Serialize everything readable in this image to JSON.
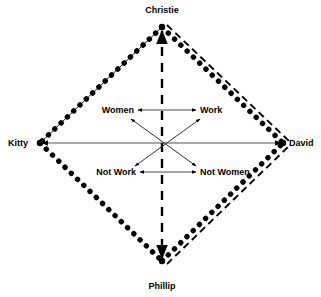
{
  "diagram": {
    "type": "semiotic-square",
    "title": "",
    "background_color": "#ffffff",
    "line_color": "#000000",
    "vertices": [
      {
        "id": "top",
        "label": "Christie",
        "x": 162,
        "y": 10,
        "point_x": 162,
        "point_y": 27
      },
      {
        "id": "left",
        "label": "Kitty",
        "x": 8,
        "y": 143,
        "point_x": 40,
        "point_y": 143
      },
      {
        "id": "right",
        "label": "David",
        "x": 313,
        "y": 143,
        "point_x": 283,
        "point_y": 143
      },
      {
        "id": "bottom",
        "label": "Phillip",
        "x": 162,
        "y": 286,
        "point_x": 162,
        "point_y": 261
      }
    ],
    "inner_labels": [
      {
        "id": "women",
        "label": "Women",
        "x": 104,
        "y": 110
      },
      {
        "id": "work",
        "label": "Work",
        "x": 215,
        "y": 110
      },
      {
        "id": "not_work",
        "label": "Not Work",
        "x": 105,
        "y": 172
      },
      {
        "id": "not_women",
        "label": "Not Women",
        "x": 217,
        "y": 172
      }
    ],
    "edges": [
      {
        "id": "top-left-edge",
        "from": "top",
        "to": "left",
        "styles": [
          "dotted",
          "thin-solid"
        ]
      },
      {
        "id": "top-right-edge",
        "from": "top",
        "to": "right",
        "styles": [
          "dotted",
          "dashed"
        ]
      },
      {
        "id": "bottom-left-edge",
        "from": "left",
        "to": "bottom",
        "styles": [
          "dotted"
        ]
      },
      {
        "id": "bottom-right-edge",
        "from": "bottom",
        "to": "right",
        "styles": [
          "dotted",
          "dashed"
        ]
      }
    ],
    "axes": [
      {
        "id": "horizontal-axis",
        "from": "left",
        "to": "right",
        "style": "solid",
        "arrows": "both"
      },
      {
        "id": "vertical-axis",
        "from": "top",
        "to": "bottom",
        "style": "dashed",
        "arrows": "both"
      }
    ],
    "arrows": [
      {
        "id": "women-work-arrow",
        "style": "solid",
        "arrows": "both",
        "x1": 138,
        "y1": 110,
        "x2": 196,
        "y2": 110
      },
      {
        "id": "notwork-notwomen-arrow",
        "style": "solid",
        "arrows": "both",
        "x1": 140,
        "y1": 172,
        "x2": 196,
        "y2": 172
      },
      {
        "id": "women-notwomen-diagonal",
        "style": "solid",
        "arrows": "both",
        "x1": 130,
        "y1": 118,
        "x2": 196,
        "y2": 165
      },
      {
        "id": "work-notwork-diagonal",
        "style": "solid",
        "arrows": "both",
        "x1": 200,
        "y1": 118,
        "x2": 134,
        "y2": 165
      }
    ]
  }
}
